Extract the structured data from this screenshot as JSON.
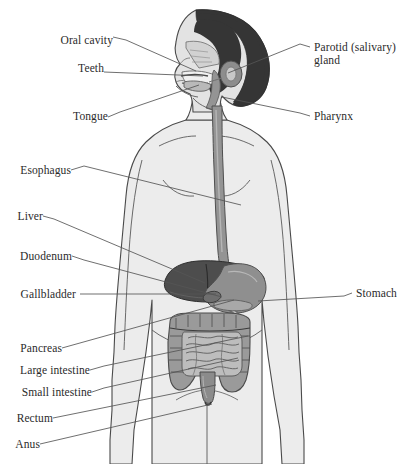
{
  "figure": {
    "orientation": "anterior view of torso with head in left profile",
    "colors": {
      "background": "#ffffff",
      "body_fill": "#ececec",
      "body_outline": "#4a4a4a",
      "hair": "#353535",
      "face_fill": "#e3e3e3",
      "esophagus": "#949494",
      "liver": "#4d4d4d",
      "stomach": "#8f8f8f",
      "gallbladder": "#6e6e6e",
      "pancreas": "#a8a8a8",
      "large_intestine": "#9a9a9a",
      "small_intestine": "#bdbdbd",
      "rectum": "#8b8b8b",
      "parotid": "#8d8d8d",
      "leader_line": "#555555",
      "label_text": "#2b2b2b"
    }
  },
  "labels": {
    "left": [
      {
        "id": "oral-cavity",
        "text": "Oral cavity",
        "x": 56,
        "y": 40,
        "anchor_x": 196,
        "anchor_y": 71
      },
      {
        "id": "teeth",
        "text": "Teeth",
        "x": 66,
        "y": 68,
        "anchor_x": 203,
        "anchor_y": 76
      },
      {
        "id": "tongue",
        "text": "Tongue",
        "x": 60,
        "y": 116,
        "anchor_x": 199,
        "anchor_y": 85
      },
      {
        "id": "esophagus",
        "text": "Esophagus",
        "x": 8,
        "y": 166,
        "anchor_x": 241,
        "anchor_y": 205
      },
      {
        "id": "liver",
        "text": "Liver",
        "x": 8,
        "y": 212,
        "anchor_x": 205,
        "anchor_y": 283
      },
      {
        "id": "duodenum",
        "text": "Duodenum",
        "x": 8,
        "y": 252,
        "anchor_x": 222,
        "anchor_y": 297
      },
      {
        "id": "gallbladder",
        "text": "Gallbladder",
        "x": 8,
        "y": 290,
        "anchor_x": 216,
        "anchor_y": 294
      },
      {
        "id": "pancreas",
        "text": "Pancreas",
        "x": 8,
        "y": 344,
        "anchor_x": 234,
        "anchor_y": 300
      },
      {
        "id": "large-intestine",
        "text": "Large intestine",
        "x": 8,
        "y": 366,
        "anchor_x": 248,
        "anchor_y": 336
      },
      {
        "id": "small-intestine",
        "text": "Small intestine",
        "x": 8,
        "y": 388,
        "anchor_x": 238,
        "anchor_y": 358
      },
      {
        "id": "rectum",
        "text": "Rectum",
        "x": 8,
        "y": 414,
        "anchor_x": 216,
        "anchor_y": 385
      },
      {
        "id": "anus",
        "text": "Anus",
        "x": 8,
        "y": 440,
        "anchor_x": 212,
        "anchor_y": 404
      }
    ],
    "right": [
      {
        "id": "parotid-gland",
        "text": "Parotid (salivary)\ngland",
        "x": 312,
        "y": 42,
        "anchor_x": 228,
        "anchor_y": 73
      },
      {
        "id": "pharynx",
        "text": "Pharynx",
        "x": 312,
        "y": 112,
        "anchor_x": 222,
        "anchor_y": 97
      },
      {
        "id": "stomach",
        "text": "Stomach",
        "x": 355,
        "y": 289,
        "anchor_x": 258,
        "anchor_y": 301
      }
    ]
  },
  "organs": [
    {
      "id": "oral-cavity",
      "name": "Oral cavity"
    },
    {
      "id": "teeth",
      "name": "Teeth"
    },
    {
      "id": "tongue",
      "name": "Tongue"
    },
    {
      "id": "parotid-gland",
      "name": "Parotid (salivary) gland"
    },
    {
      "id": "pharynx",
      "name": "Pharynx"
    },
    {
      "id": "esophagus",
      "name": "Esophagus"
    },
    {
      "id": "stomach",
      "name": "Stomach"
    },
    {
      "id": "liver",
      "name": "Liver"
    },
    {
      "id": "duodenum",
      "name": "Duodenum"
    },
    {
      "id": "gallbladder",
      "name": "Gallbladder"
    },
    {
      "id": "pancreas",
      "name": "Pancreas"
    },
    {
      "id": "large-intestine",
      "name": "Large intestine"
    },
    {
      "id": "small-intestine",
      "name": "Small intestine"
    },
    {
      "id": "rectum",
      "name": "Rectum"
    },
    {
      "id": "anus",
      "name": "Anus"
    }
  ]
}
